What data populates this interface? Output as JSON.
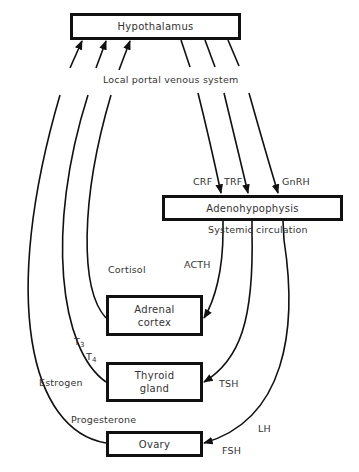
{
  "diagram": {
    "nodes": {
      "hypothalamus": "Hypothalamus",
      "adenohypophysis": "Adenohypophysis",
      "adrenal": "Adrenal cortex",
      "adrenal_line1": "Adrenal",
      "adrenal_line2": "cortex",
      "thyroid_line1": "Thyroid",
      "thyroid_line2": "gland",
      "ovary": "Ovary"
    },
    "labels": {
      "local_portal": "Local portal venous system",
      "systemic": "Systemic circulation",
      "crf": "CRF",
      "trf": "TRF",
      "gnrh": "GnRH",
      "acth": "ACTH",
      "tsh": "TSH",
      "lh": "LH",
      "fsh": "FSH",
      "cortisol": "Cortisol",
      "t3_base": "T",
      "t3_sub": "3",
      "t4_base": "T",
      "t4_sub": "4",
      "estrogen": "Estrogen",
      "progesterone": "Progesterone"
    },
    "edges": [
      {
        "from": "Hypothalamus",
        "to": "Adenohypophysis",
        "label": "CRF",
        "via": "Local portal venous system"
      },
      {
        "from": "Hypothalamus",
        "to": "Adenohypophysis",
        "label": "TRF",
        "via": "Local portal venous system"
      },
      {
        "from": "Hypothalamus",
        "to": "Adenohypophysis",
        "label": "GnRH",
        "via": "Local portal venous system"
      },
      {
        "from": "Adenohypophysis",
        "to": "Adrenal cortex",
        "label": "ACTH",
        "via": "Systemic circulation"
      },
      {
        "from": "Adenohypophysis",
        "to": "Thyroid gland",
        "label": "TSH",
        "via": "Systemic circulation"
      },
      {
        "from": "Adenohypophysis",
        "to": "Ovary",
        "label": "LH / FSH",
        "via": "Systemic circulation"
      },
      {
        "from": "Adrenal cortex",
        "to": "Hypothalamus",
        "label": "Cortisol"
      },
      {
        "from": "Thyroid gland",
        "to": "Hypothalamus",
        "label": "T3 / T4"
      },
      {
        "from": "Ovary",
        "to": "Hypothalamus",
        "label": "Estrogen / Progesterone"
      }
    ],
    "colors": {
      "line": "#111111",
      "text": "#333333",
      "background": "#ffffff"
    }
  }
}
